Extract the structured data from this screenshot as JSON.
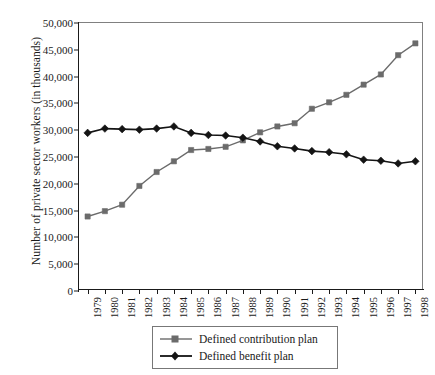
{
  "chart_data": {
    "type": "line",
    "title": "",
    "xlabel": "",
    "ylabel": "Number of private sector workers (in thousands)",
    "x": [
      1979,
      1980,
      1981,
      1982,
      1983,
      1984,
      1985,
      1986,
      1987,
      1988,
      1989,
      1990,
      1991,
      1992,
      1993,
      1994,
      1995,
      1996,
      1997,
      1998
    ],
    "categories": [
      "1979",
      "1980",
      "1981",
      "1982",
      "1983",
      "1984",
      "1985",
      "1986",
      "1987",
      "1988",
      "1989",
      "1990",
      "1991",
      "1992",
      "1993",
      "1994",
      "1995",
      "1996",
      "1997",
      "1998"
    ],
    "series": [
      {
        "name": "Defined contribution plan",
        "marker": "square",
        "color": "#6b6b6b",
        "values": [
          13900,
          14900,
          16100,
          19600,
          22200,
          24200,
          26300,
          26500,
          26900,
          28100,
          29600,
          30700,
          31300,
          34000,
          35200,
          36600,
          38500,
          40400,
          44000,
          46200
        ]
      },
      {
        "name": "Defined benefit plan",
        "marker": "diamond",
        "color": "#141414",
        "values": [
          29500,
          30300,
          30200,
          30100,
          30300,
          30700,
          29500,
          29100,
          29000,
          28600,
          27900,
          27000,
          26600,
          26100,
          25900,
          25500,
          24500,
          24300,
          23800,
          24200
        ]
      }
    ],
    "ylim": [
      0,
      50000
    ],
    "y_ticks": [
      0,
      5000,
      10000,
      15000,
      20000,
      25000,
      30000,
      35000,
      40000,
      45000,
      50000
    ],
    "y_tick_labels": [
      "0",
      "5,000",
      "10,000",
      "15,000",
      "20,000",
      "25,000",
      "30,000",
      "35,000",
      "40,000",
      "45,000",
      "50,000"
    ],
    "grid": false,
    "legend_position": "bottom-center",
    "legend_entries": [
      "Defined contribution plan",
      "Defined benefit plan"
    ]
  },
  "axes": {
    "y_title": "Number of private sector workers (in thousands)"
  },
  "legend": {
    "entries": [
      {
        "label": "Defined contribution plan",
        "marker": "square-marker",
        "color": "#6b6b6b"
      },
      {
        "label": "Defined benefit plan",
        "marker": "diamond-marker",
        "color": "#141414"
      }
    ]
  }
}
